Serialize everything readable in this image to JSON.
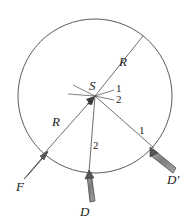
{
  "figure": {
    "background_color": "#ffffff",
    "stroke_color": "#4a4a4a",
    "arrow_fill_color": "#8a8a8a",
    "arrow_edge_color": "#3a3a3a",
    "text_color": "#222222",
    "circle": {
      "center_x": 95,
      "center_y": 96,
      "radius": 77
    },
    "center_point": {
      "name": "S",
      "label": "S",
      "x": 95,
      "y": 96
    },
    "radius_labels": [
      {
        "id": "R-upper-right",
        "label": "R",
        "x": 122,
        "y": 62
      },
      {
        "id": "R-lower-left",
        "label": "R",
        "x": 55,
        "y": 122
      }
    ],
    "segment_labels": [
      {
        "id": "one-near-center",
        "label": "1",
        "x": 117,
        "y": 89
      },
      {
        "id": "two-near-center",
        "label": "2",
        "x": 117,
        "y": 99
      },
      {
        "id": "two-lower-middle",
        "label": "2",
        "x": 95,
        "y": 146
      },
      {
        "id": "one-lower-right",
        "label": "1",
        "x": 141,
        "y": 131
      }
    ],
    "vectors": [
      {
        "id": "F",
        "label": "F",
        "label_x": 18,
        "label_y": 185,
        "tip_x": 43,
        "tip_y": 155,
        "tail_x": 22,
        "tail_y": 178
      },
      {
        "id": "D",
        "label": "D",
        "label_x": 82,
        "label_y": 210,
        "tip_x": 88,
        "tip_y": 172,
        "tail_x": 92,
        "tail_y": 201
      },
      {
        "id": "Dprime",
        "label": "D'",
        "label_x": 170,
        "label_y": 178,
        "tip_x": 152,
        "tip_y": 150,
        "tail_x": 172,
        "tail_y": 170
      }
    ]
  }
}
